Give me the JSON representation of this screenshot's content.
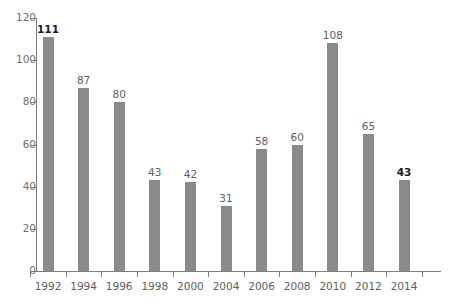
{
  "chart_data": {
    "type": "bar",
    "title": "",
    "subtitle": "",
    "xlabel": "",
    "ylabel": "",
    "categories": [
      "1992",
      "1994",
      "1996",
      "1998",
      "2000",
      "2004",
      "2006",
      "2008",
      "2010",
      "2012",
      "2014"
    ],
    "values": [
      111,
      87,
      80,
      43,
      42,
      31,
      58,
      60,
      108,
      65,
      43
    ],
    "value_labels": [
      "111",
      "87",
      "80",
      "43",
      "42",
      "31",
      "58",
      "60",
      "108",
      "65",
      "43"
    ],
    "emphasized_points": [
      {
        "category": "1992",
        "value": 111,
        "style": "bold"
      },
      {
        "category": "2014",
        "value": 43,
        "style": "bold"
      }
    ],
    "ylim": [
      0,
      120
    ],
    "ytick_values": [
      0,
      20,
      40,
      60,
      80,
      100,
      120
    ],
    "ytick_labels": [
      "0",
      "20",
      "40",
      "60",
      "80",
      "100",
      "120"
    ],
    "grid": false,
    "legend": "none",
    "bar_color": "#8a8a8a",
    "axis_color": "#7d7d7d",
    "label_color": "#5e5e5e",
    "emphasis_color": "#1d1d1d",
    "background_color": "#ffffff"
  }
}
